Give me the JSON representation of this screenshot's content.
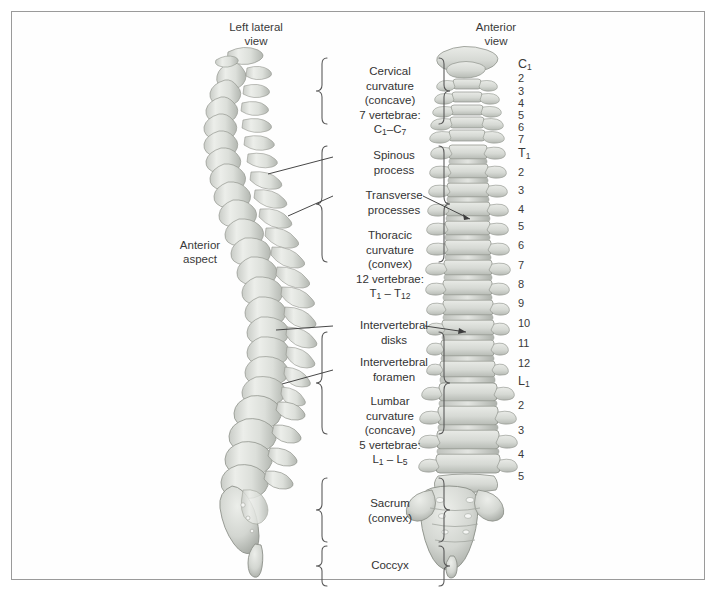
{
  "figure": {
    "background_color": "#ffffff",
    "frame_color": "#9a9a9a",
    "bone_color": "#d9dbd6",
    "bone_shadow_color": "#a9aca6",
    "text_color": "#333333"
  },
  "headers": {
    "left_view": "Left lateral\nview",
    "right_view": "Anterior\nview"
  },
  "left_annotation": {
    "anterior_aspect": "Anterior\naspect"
  },
  "regions": [
    {
      "id": "cervical",
      "line1": "Cervical",
      "line2": "curvature",
      "line3": "(concave)",
      "line4": "7 vertebrae:",
      "range_prefix": "C",
      "range_from": "1",
      "range_dash": "–",
      "range_to_prefix": "C",
      "range_to": "7"
    },
    {
      "id": "thoracic",
      "line1": "Thoracic",
      "line2": "curvature",
      "line3": "(convex)",
      "line4": "12 vertebrae:",
      "range_prefix": "T",
      "range_from": "1",
      "range_dash": "–",
      "range_to_prefix": "T",
      "range_to": "12"
    },
    {
      "id": "lumbar",
      "line1": "Lumbar",
      "line2": "curvature",
      "line3": "(concave)",
      "line4": "5 vertebrae:",
      "range_prefix": "L",
      "range_from": "1",
      "range_dash": "–",
      "range_to_prefix": "L",
      "range_to": "5"
    },
    {
      "id": "sacrum",
      "line1": "Sacrum",
      "line2": "(convex)",
      "line3": "",
      "line4": "",
      "range_prefix": "",
      "range_from": "",
      "range_dash": "",
      "range_to_prefix": "",
      "range_to": ""
    },
    {
      "id": "coccyx",
      "line1": "Coccyx",
      "line2": "",
      "line3": "",
      "line4": "",
      "range_prefix": "",
      "range_from": "",
      "range_dash": "",
      "range_to_prefix": "",
      "range_to": ""
    }
  ],
  "callouts": [
    {
      "id": "spinous-process",
      "text": "Spinous\nprocess"
    },
    {
      "id": "transverse-processes",
      "text": "Transverse\nprocesses"
    },
    {
      "id": "intervertebral-disks",
      "text": "Intervertebral\ndisks"
    },
    {
      "id": "intervertebral-foramen",
      "text": "Intervertebral\nforamen"
    }
  ],
  "vertebra_numbers": [
    {
      "label": "C",
      "sub": "1",
      "major": true,
      "y": 57
    },
    {
      "label": "2",
      "sub": "",
      "major": false,
      "y": 72
    },
    {
      "label": "3",
      "sub": "",
      "major": false,
      "y": 85
    },
    {
      "label": "4",
      "sub": "",
      "major": false,
      "y": 97
    },
    {
      "label": "5",
      "sub": "",
      "major": false,
      "y": 109
    },
    {
      "label": "6",
      "sub": "",
      "major": false,
      "y": 121
    },
    {
      "label": "7",
      "sub": "",
      "major": false,
      "y": 133
    },
    {
      "label": "T",
      "sub": "1",
      "major": true,
      "y": 146
    },
    {
      "label": "2",
      "sub": "",
      "major": false,
      "y": 166
    },
    {
      "label": "3",
      "sub": "",
      "major": false,
      "y": 184
    },
    {
      "label": "4",
      "sub": "",
      "major": false,
      "y": 203
    },
    {
      "label": "5",
      "sub": "",
      "major": false,
      "y": 220
    },
    {
      "label": "6",
      "sub": "",
      "major": false,
      "y": 239
    },
    {
      "label": "7",
      "sub": "",
      "major": false,
      "y": 259
    },
    {
      "label": "8",
      "sub": "",
      "major": false,
      "y": 278
    },
    {
      "label": "9",
      "sub": "",
      "major": false,
      "y": 297
    },
    {
      "label": "10",
      "sub": "",
      "major": false,
      "y": 317
    },
    {
      "label": "11",
      "sub": "",
      "major": false,
      "y": 337
    },
    {
      "label": "12",
      "sub": "",
      "major": false,
      "y": 357
    },
    {
      "label": "L",
      "sub": "1",
      "major": true,
      "y": 374
    },
    {
      "label": "2",
      "sub": "",
      "major": false,
      "y": 399
    },
    {
      "label": "3",
      "sub": "",
      "major": false,
      "y": 424
    },
    {
      "label": "4",
      "sub": "",
      "major": false,
      "y": 448
    },
    {
      "label": "5",
      "sub": "",
      "major": false,
      "y": 470
    }
  ]
}
